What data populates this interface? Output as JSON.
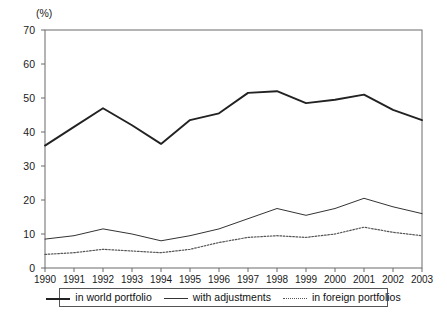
{
  "chart_data": {
    "type": "line",
    "title": "",
    "subtitle": "",
    "xlabel": "",
    "ylabel": "",
    "unit_label": "(%)",
    "categories": [
      "1990",
      "1991",
      "1992",
      "1993",
      "1994",
      "1995",
      "1996",
      "1997",
      "1998",
      "1999",
      "2000",
      "2001",
      "2002",
      "2003"
    ],
    "x": [
      1990,
      1991,
      1992,
      1993,
      1994,
      1995,
      1996,
      1997,
      1998,
      1999,
      2000,
      2001,
      2002,
      2003
    ],
    "ylim": [
      0,
      70
    ],
    "ytick_step": 10,
    "yticks": [
      "0",
      "10",
      "20",
      "30",
      "40",
      "50",
      "60",
      "70"
    ],
    "grid": false,
    "frame": true,
    "legend_position": "bottom",
    "series": [
      {
        "name": "in world portfolio",
        "style": "solid-thick",
        "color": "#222222",
        "values": [
          36.0,
          41.5,
          47.0,
          42.0,
          36.5,
          43.5,
          45.5,
          51.5,
          52.0,
          48.5,
          49.5,
          51.0,
          46.5,
          43.5
        ]
      },
      {
        "name": "with adjustments",
        "style": "solid-thin",
        "color": "#333333",
        "values": [
          8.5,
          9.5,
          11.5,
          10.0,
          8.0,
          9.5,
          11.5,
          14.5,
          17.5,
          15.5,
          17.5,
          20.5,
          18.0,
          16.0
        ]
      },
      {
        "name": "in foreign portfolios",
        "style": "dotted",
        "color": "#555555",
        "values": [
          4.0,
          4.5,
          5.5,
          5.0,
          4.5,
          5.5,
          7.5,
          9.0,
          9.5,
          9.0,
          10.0,
          12.0,
          10.5,
          9.5
        ]
      }
    ]
  },
  "legend": {
    "items": [
      {
        "label": "in world portfolio",
        "swatch": "solid-thick"
      },
      {
        "label": "with adjustments",
        "swatch": "solid-thin"
      },
      {
        "label": "in foreign portfolios",
        "swatch": "dotted"
      }
    ]
  }
}
